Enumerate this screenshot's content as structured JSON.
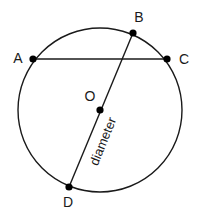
{
  "diagram": {
    "colors": {
      "stroke": "#1a1a1a",
      "background": "#ffffff"
    },
    "circle": {
      "cx": 100,
      "cy": 110,
      "r": 82
    },
    "points": [
      {
        "id": "A",
        "label": "A",
        "x": 33,
        "y": 59,
        "lx": 18,
        "ly": 63
      },
      {
        "id": "B",
        "label": "B",
        "x": 133,
        "y": 33,
        "lx": 139,
        "ly": 22
      },
      {
        "id": "C",
        "label": "C",
        "x": 167,
        "y": 59,
        "lx": 184,
        "ly": 64
      },
      {
        "id": "O",
        "label": "O",
        "x": 100,
        "y": 110,
        "lx": 90,
        "ly": 101
      },
      {
        "id": "D",
        "label": "D",
        "x": 69,
        "y": 187,
        "lx": 68,
        "ly": 207
      }
    ],
    "segments": [
      {
        "name": "chord-AC",
        "from": "A",
        "to": "C"
      },
      {
        "name": "diameter-BD",
        "from": "B",
        "to": "D"
      }
    ],
    "annotation": {
      "text": "diameter",
      "x": 107,
      "y": 143,
      "rotate": -68
    }
  }
}
